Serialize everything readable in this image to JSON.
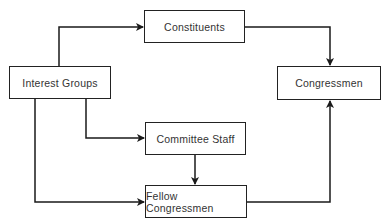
{
  "diagram": {
    "type": "flowchart",
    "nodes": [
      {
        "id": "constituents",
        "label": "Constituents",
        "x": 144,
        "y": 10,
        "w": 101,
        "h": 33
      },
      {
        "id": "interest_groups",
        "label": "Interest Groups",
        "x": 9,
        "y": 66,
        "w": 102,
        "h": 33
      },
      {
        "id": "congressmen",
        "label": "Congressmen",
        "x": 277,
        "y": 66,
        "w": 104,
        "h": 34
      },
      {
        "id": "committee_staff",
        "label": "Committee Staff",
        "x": 145,
        "y": 122,
        "w": 101,
        "h": 33
      },
      {
        "id": "fellow_congressmen",
        "label": "Fellow Congressmen",
        "x": 145,
        "y": 185,
        "w": 102,
        "h": 33
      }
    ],
    "edges": [
      {
        "from": "interest_groups",
        "to": "constituents"
      },
      {
        "from": "constituents",
        "to": "congressmen"
      },
      {
        "from": "interest_groups",
        "to": "committee_staff"
      },
      {
        "from": "interest_groups",
        "to": "fellow_congressmen"
      },
      {
        "from": "committee_staff",
        "to": "fellow_congressmen"
      },
      {
        "from": "fellow_congressmen",
        "to": "congressmen"
      }
    ],
    "line_color": "#1a1a1a"
  }
}
